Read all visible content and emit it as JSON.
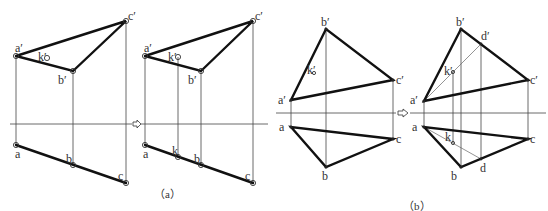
{
  "figure": {
    "captions": {
      "a": "（a）",
      "b": "（b）"
    },
    "arrow_symbol": "⇨",
    "panel_a_left": {
      "labels": {
        "a1": "a′",
        "b1": "b′",
        "c1": "c′",
        "k1": "k′",
        "a": "a",
        "b": "b",
        "c": "c"
      }
    },
    "panel_a_right": {
      "labels": {
        "a1": "a′",
        "b1": "b′",
        "c1": "c′",
        "k1": "k′",
        "a": "a",
        "b": "b",
        "c": "c",
        "k": "k"
      }
    },
    "panel_b_left": {
      "labels": {
        "a1": "a′",
        "b1": "b′",
        "c1": "c′",
        "k1": "k′",
        "a": "a",
        "b": "b",
        "c": "c"
      }
    },
    "panel_b_right": {
      "labels": {
        "a1": "a′",
        "b1": "b′",
        "c1": "c′",
        "d1": "d′",
        "k1": "k′",
        "a": "a",
        "b": "b",
        "c": "c",
        "d": "d",
        "k": "k"
      }
    }
  }
}
